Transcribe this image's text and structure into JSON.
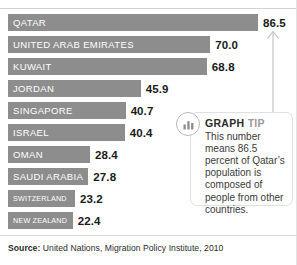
{
  "chart_data": {
    "type": "bar",
    "title": "",
    "xlabel": "",
    "ylabel": "",
    "orientation": "horizontal",
    "xlim": [
      0,
      86.5
    ],
    "grid": false,
    "legend": "none",
    "value_unit": "percent",
    "categories": [
      "QATAR",
      "UNITED ARAB EMIRATES",
      "KUWAIT",
      "JORDAN",
      "SINGAPORE",
      "ISRAEL",
      "OMAN",
      "SAUDI ARABIA",
      "SWITZERLAND",
      "NEW ZEALAND"
    ],
    "values": [
      86.5,
      70.0,
      68.8,
      45.9,
      40.7,
      40.4,
      28.4,
      27.8,
      23.2,
      22.4
    ],
    "value_labels": [
      "86.5",
      "70.0",
      "68.8",
      "45.9",
      "40.7",
      "40.4",
      "28.4",
      "27.8",
      "23.2",
      "22.4"
    ],
    "bar_color": "#8d8d8d",
    "label_color": "#ffffff",
    "value_color": "#1a1a1a"
  },
  "tip": {
    "badge_icon": "bar-chart-icon",
    "heading_primary": "GRAPH",
    "heading_secondary": "TIP",
    "body": "This number means 86.5 percent of Qatar’s population is composed of people from other countries.",
    "pointer_icon": "up-arrow-icon"
  },
  "footer": {
    "source_label": "Source:",
    "source_text": "United Nations, Migration Policy Institute, 2010"
  }
}
